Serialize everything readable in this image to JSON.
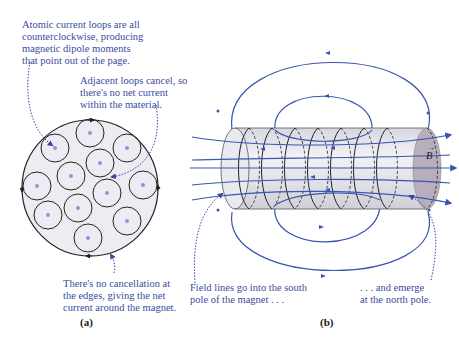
{
  "panel_a": {
    "label": "(a)",
    "annotations": {
      "top": "Atomic current loops are all\ncounterclockwise, producing\nmagnetic dipole moments\nthat point out of the page.",
      "middle": "Adjacent loops cancel, so\nthere's no net current\nwithin the material.",
      "bottom": "There's no cancellation at\nthe edges, giving the net\ncurrent around the magnet."
    }
  },
  "panel_b": {
    "label": "(b)",
    "field_symbol": "B",
    "field_vector_arrow": "→",
    "annotations": {
      "left": "Field lines go into the south\npole of the magnet . . .",
      "right": ". . . and emerge\nat the north pole."
    }
  },
  "colors": {
    "annotation_text": "#3a4aa0",
    "field_line": "#3b55b0",
    "cylinder_body": "#e6e6ee",
    "cylinder_end": "#b9aebb",
    "loop": "#222222"
  }
}
